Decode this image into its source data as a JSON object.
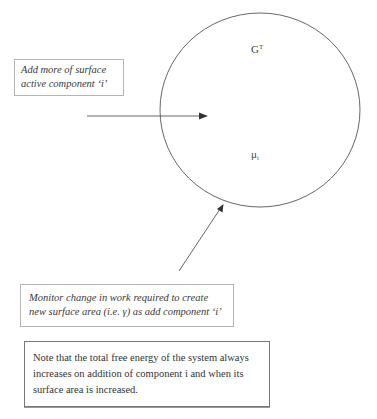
{
  "diagram": {
    "circle_labels": {
      "top": {
        "main": "G",
        "superscript": "T"
      },
      "bottom": {
        "main": "μ",
        "subscript": "i"
      }
    },
    "boxes": [
      {
        "id": "add-component",
        "lines": [
          "Add more of surface",
          "active component ‘i’"
        ],
        "style": "italic"
      },
      {
        "id": "monitor-change",
        "lines": [
          "Monitor change in work required to create",
          "new surface area (i.e. γ) as add component ‘i’"
        ],
        "style": "italic"
      },
      {
        "id": "note",
        "lines": [
          "Note that the total free energy of the system always",
          "increases on addition of component i and when its",
          "surface area is increased."
        ],
        "style": "normal"
      }
    ],
    "arrows": [
      {
        "from": "add-component",
        "to": "circle-interior",
        "direction": "right"
      },
      {
        "from": "monitor-change",
        "to": "circle-boundary",
        "direction": "up-right"
      }
    ],
    "colors": {
      "line": "#555555",
      "box_border_light": "#b5b5b5",
      "box_border_dark": "#777777"
    }
  }
}
